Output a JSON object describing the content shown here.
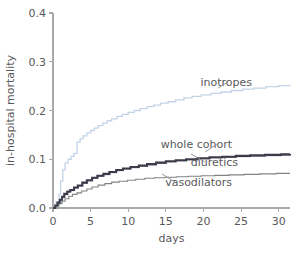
{
  "chart_data": {
    "type": "line",
    "title": "",
    "subtitle": "",
    "xlabel": "days",
    "ylabel": "in-hospital mortality",
    "xlim": [
      0,
      31.5
    ],
    "ylim": [
      0,
      0.4
    ],
    "grid": false,
    "legend_position": "inline-right-annotations",
    "xticks": [
      0,
      5,
      10,
      15,
      20,
      25,
      30
    ],
    "xtick_labels": [
      "0",
      "5",
      "10",
      "15",
      "20",
      "25",
      "30"
    ],
    "yticks": [
      0.0,
      0.1,
      0.2,
      0.3,
      0.4
    ],
    "ytick_labels": [
      "0.0",
      "0.1",
      "0.2",
      "0.3",
      "0.4"
    ],
    "colors": {
      "inotropes": "#c3d3e8",
      "whole_cohort": "#3b3b4a",
      "diuretics": "#9aa3b5",
      "vasodilators": "#808285",
      "axis": "#a7a9ac",
      "text": "#58595b"
    },
    "series": [
      {
        "name": "inotropes",
        "color": "#c3d3e8",
        "label": "inotropes",
        "label_x": 252,
        "label_y": 86,
        "x": [
          0,
          0.4,
          0.8,
          1.0,
          1.3,
          1.6,
          2.0,
          2.4,
          2.8,
          3.2,
          3.6,
          4.0,
          4.5,
          5.0,
          5.5,
          6.0,
          6.6,
          7.2,
          7.8,
          8.5,
          9.2,
          10.0,
          10.8,
          11.6,
          12.5,
          13.4,
          14.3,
          15.3,
          16.3,
          17.4,
          18.5,
          19.7,
          21.0,
          22.3,
          23.7,
          25.2,
          26.7,
          28.3,
          30.0,
          31.5
        ],
        "y": [
          0.0,
          0.012,
          0.028,
          0.055,
          0.078,
          0.092,
          0.1,
          0.106,
          0.112,
          0.135,
          0.142,
          0.148,
          0.154,
          0.159,
          0.164,
          0.169,
          0.174,
          0.179,
          0.183,
          0.188,
          0.192,
          0.196,
          0.2,
          0.204,
          0.208,
          0.211,
          0.215,
          0.218,
          0.222,
          0.226,
          0.229,
          0.232,
          0.235,
          0.238,
          0.241,
          0.244,
          0.246,
          0.249,
          0.251,
          0.253
        ]
      },
      {
        "name": "whole_cohort",
        "color": "#3b3b4a",
        "label": "whole cohort",
        "label_x": 232,
        "label_y": 148,
        "x": [
          0,
          0.3,
          0.6,
          0.9,
          1.2,
          1.5,
          1.9,
          2.3,
          2.8,
          3.3,
          3.9,
          4.5,
          5.2,
          5.9,
          6.7,
          7.5,
          8.4,
          9.3,
          10.3,
          11.4,
          12.5,
          13.7,
          15.0,
          16.3,
          17.7,
          19.2,
          20.8,
          22.5,
          24.3,
          26.2,
          28.2,
          30.3,
          31.5
        ],
        "y": [
          0.0,
          0.005,
          0.011,
          0.017,
          0.023,
          0.029,
          0.034,
          0.037,
          0.042,
          0.046,
          0.052,
          0.057,
          0.062,
          0.066,
          0.07,
          0.074,
          0.078,
          0.081,
          0.084,
          0.087,
          0.09,
          0.093,
          0.096,
          0.098,
          0.1,
          0.102,
          0.104,
          0.105,
          0.107,
          0.108,
          0.109,
          0.11,
          0.111
        ]
      },
      {
        "name": "diuretics",
        "color": "#9aa3b5",
        "label": "diuretics",
        "label_x": 238,
        "label_y": 166,
        "x": [
          0,
          0.3,
          0.6,
          0.9,
          1.2,
          1.5,
          1.9,
          2.3,
          2.8,
          3.3,
          3.9,
          4.5,
          5.2,
          5.9,
          6.7,
          7.5,
          8.4,
          9.3,
          10.3,
          11.4,
          12.5,
          13.7,
          15.0,
          16.3,
          17.7,
          19.2,
          20.8,
          22.5,
          24.3,
          26.2,
          28.2,
          30.3,
          31.5
        ],
        "y": [
          0.0,
          0.004,
          0.01,
          0.016,
          0.022,
          0.028,
          0.033,
          0.036,
          0.041,
          0.045,
          0.051,
          0.056,
          0.061,
          0.065,
          0.069,
          0.073,
          0.077,
          0.08,
          0.083,
          0.086,
          0.089,
          0.092,
          0.095,
          0.097,
          0.099,
          0.101,
          0.103,
          0.104,
          0.106,
          0.107,
          0.108,
          0.109,
          0.11
        ]
      },
      {
        "name": "vasodilators",
        "color": "#808285",
        "label": "vasodilators",
        "label_x": 232,
        "label_y": 186,
        "x": [
          0,
          0.4,
          0.8,
          1.2,
          1.6,
          2.1,
          2.6,
          3.2,
          3.8,
          4.5,
          5.2,
          6.0,
          6.9,
          7.8,
          8.8,
          9.9,
          11.0,
          12.2,
          13.5,
          14.9,
          16.4,
          18.0,
          19.7,
          21.5,
          23.4,
          25.4,
          27.5,
          29.7,
          31.5
        ],
        "y": [
          0.0,
          0.004,
          0.009,
          0.014,
          0.019,
          0.024,
          0.028,
          0.031,
          0.035,
          0.039,
          0.043,
          0.047,
          0.05,
          0.053,
          0.055,
          0.057,
          0.059,
          0.061,
          0.062,
          0.063,
          0.064,
          0.065,
          0.066,
          0.067,
          0.068,
          0.069,
          0.07,
          0.071,
          0.071
        ]
      }
    ]
  }
}
